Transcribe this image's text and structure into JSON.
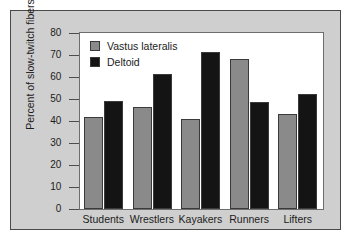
{
  "chart_data": {
    "type": "bar",
    "title": "",
    "xlabel": "",
    "ylabel": "Percent of slow-twitch fibers",
    "ylim": [
      0,
      80
    ],
    "yticks": [
      0,
      10,
      20,
      30,
      40,
      50,
      60,
      70,
      80
    ],
    "ytick_labels": [
      "0",
      "10",
      "20",
      "30",
      "40",
      "50",
      "60",
      "70",
      "80"
    ],
    "grid": false,
    "legend_position": "top-left",
    "categories": [
      "Students",
      "Wrestlers",
      "Kayakers",
      "Runners",
      "Lifters"
    ],
    "series": [
      {
        "name": "Vastus lateralis",
        "color": "#8a8a8a",
        "values": [
          42,
          46.5,
          41,
          68,
          43
        ]
      },
      {
        "name": "Deltoid",
        "color": "#141414",
        "values": [
          49,
          61.5,
          71.5,
          48.5,
          52.5
        ]
      }
    ]
  },
  "figure": {
    "background": "#cfcfcf",
    "plot_background": "#ffffff",
    "border_color": "#4a4a4a"
  }
}
